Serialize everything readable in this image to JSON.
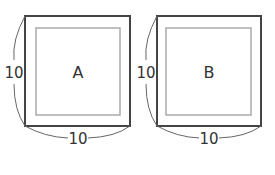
{
  "figures": [
    {
      "name": "A",
      "label": "A",
      "side_label": "10",
      "bottom_label": "10"
    },
    {
      "name": "B",
      "label": "B",
      "side_label": "10",
      "bottom_label": "10"
    }
  ],
  "colors": {
    "outer": "#444444",
    "inner": "#aaaaaa",
    "brace": "#666666",
    "text": "#333333"
  }
}
